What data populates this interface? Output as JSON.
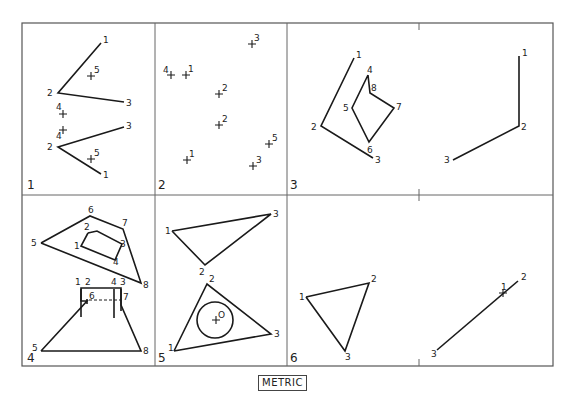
{
  "footer": {
    "label": "METRIC"
  },
  "panels": [
    {
      "id": "1",
      "lines": [
        [
          [
            101,
            43
          ],
          [
            58,
            93
          ],
          [
            124,
            102
          ]
        ],
        [
          [
            124,
            127
          ],
          [
            58,
            147
          ],
          [
            101,
            174
          ]
        ]
      ],
      "points": [
        {
          "t": "1",
          "x": 101,
          "y": 43,
          "dx": 2,
          "dy": 0
        },
        {
          "t": "2",
          "x": 58,
          "y": 93,
          "dx": -11,
          "dy": 3
        },
        {
          "t": "3",
          "x": 124,
          "y": 102,
          "dx": 2,
          "dy": 4
        },
        {
          "t": "5",
          "x": 91,
          "y": 76,
          "dx": 3,
          "dy": -3,
          "cross": true
        },
        {
          "t": "4",
          "x": 63,
          "y": 114,
          "dx": -7,
          "dy": -4,
          "cross": true
        },
        {
          "t": "4",
          "x": 63,
          "y": 130,
          "dx": -7,
          "dy": 9,
          "cross": true
        },
        {
          "t": "3",
          "x": 124,
          "y": 127,
          "dx": 2,
          "dy": 2
        },
        {
          "t": "2",
          "x": 58,
          "y": 147,
          "dx": -11,
          "dy": 3
        },
        {
          "t": "5",
          "x": 91,
          "y": 159,
          "dx": 3,
          "dy": -3,
          "cross": true
        },
        {
          "t": "1",
          "x": 101,
          "y": 174,
          "dx": 2,
          "dy": 4
        }
      ]
    },
    {
      "id": "2",
      "lines": [],
      "points": [
        {
          "t": "3",
          "x": 252,
          "y": 44,
          "dx": 2,
          "dy": -3,
          "cross": true
        },
        {
          "t": "4",
          "x": 171,
          "y": 75,
          "dx": -8,
          "dy": -2,
          "cross": true
        },
        {
          "t": "1",
          "x": 186,
          "y": 75,
          "dx": 2,
          "dy": -3,
          "cross": true
        },
        {
          "t": "2",
          "x": 219,
          "y": 94,
          "dx": 3,
          "dy": -3,
          "cross": true
        },
        {
          "t": "2",
          "x": 219,
          "y": 125,
          "dx": 3,
          "dy": -3,
          "cross": true
        },
        {
          "t": "5",
          "x": 269,
          "y": 144,
          "dx": 3,
          "dy": -3,
          "cross": true
        },
        {
          "t": "1",
          "x": 187,
          "y": 160,
          "dx": 2,
          "dy": -3,
          "cross": true
        },
        {
          "t": "3",
          "x": 253,
          "y": 166,
          "dx": 3,
          "dy": -3,
          "cross": true
        }
      ]
    },
    {
      "id": "3",
      "lines": [
        [
          [
            354,
            58
          ],
          [
            321,
            126
          ],
          [
            373,
            158
          ]
        ],
        [
          [
            368,
            75
          ],
          [
            352,
            108
          ],
          [
            369,
            142
          ],
          [
            394,
            108
          ],
          [
            370,
            93
          ],
          [
            368,
            75
          ]
        ]
      ],
      "points": [
        {
          "t": "1",
          "x": 354,
          "y": 58,
          "dx": 2,
          "dy": 0
        },
        {
          "t": "2",
          "x": 321,
          "y": 126,
          "dx": -10,
          "dy": 4
        },
        {
          "t": "3",
          "x": 373,
          "y": 158,
          "dx": 2,
          "dy": 5
        },
        {
          "t": "4",
          "x": 368,
          "y": 75,
          "dx": -1,
          "dy": -2
        },
        {
          "t": "8",
          "x": 370,
          "y": 93,
          "dx": 1,
          "dy": -2
        },
        {
          "t": "5",
          "x": 352,
          "y": 108,
          "dx": -9,
          "dy": 3
        },
        {
          "t": "7",
          "x": 394,
          "y": 108,
          "dx": 2,
          "dy": 2
        },
        {
          "t": "6",
          "x": 369,
          "y": 142,
          "dx": -2,
          "dy": 11
        }
      ]
    },
    {
      "id": "",
      "lines": [
        [
          [
            519,
            56
          ],
          [
            519,
            126
          ],
          [
            453,
            160
          ]
        ]
      ],
      "points": [
        {
          "t": "1",
          "x": 519,
          "y": 56,
          "dx": 3,
          "dy": 0
        },
        {
          "t": "2",
          "x": 519,
          "y": 126,
          "dx": 2,
          "dy": 4
        },
        {
          "t": "3",
          "x": 453,
          "y": 160,
          "dx": -9,
          "dy": 3
        }
      ]
    },
    {
      "id": "4",
      "lines": [
        [
          [
            41,
            243
          ],
          [
            90,
            216
          ],
          [
            123,
            229
          ],
          [
            141,
            283
          ],
          [
            41,
            243
          ]
        ],
        [
          [
            88,
            233
          ],
          [
            97,
            231
          ],
          [
            122,
            244
          ],
          [
            115,
            260
          ],
          [
            81,
            246
          ],
          [
            88,
            233
          ]
        ],
        [
          [
            41,
            351
          ],
          [
            87,
            301
          ],
          [
            81,
            301
          ],
          [
            81,
            288
          ],
          [
            121,
            288
          ],
          [
            121,
            305
          ],
          [
            141,
            351
          ],
          [
            41,
            351
          ]
        ]
      ],
      "extra": [
        [
          [
            81,
            289
          ],
          [
            81,
            317
          ]
        ],
        [
          [
            114,
            289
          ],
          [
            114,
            318
          ]
        ],
        [
          [
            121,
            289
          ],
          [
            121,
            311
          ]
        ],
        [
          [
            87,
            299
          ],
          [
            87,
            304
          ]
        ]
      ],
      "dashed": [
        [
          [
            89,
            300
          ],
          [
            121,
            300
          ]
        ]
      ],
      "points": [
        {
          "t": "6",
          "x": 90,
          "y": 216,
          "dx": -2,
          "dy": -3
        },
        {
          "t": "7",
          "x": 123,
          "y": 229,
          "dx": -1,
          "dy": -3
        },
        {
          "t": "2",
          "x": 88,
          "y": 233,
          "dx": -4,
          "dy": -3
        },
        {
          "t": "5",
          "x": 41,
          "y": 243,
          "dx": -10,
          "dy": 3
        },
        {
          "t": "1",
          "x": 81,
          "y": 246,
          "dx": -7,
          "dy": 3
        },
        {
          "t": "3",
          "x": 122,
          "y": 244,
          "dx": -2,
          "dy": 3
        },
        {
          "t": "4",
          "x": 115,
          "y": 260,
          "dx": -2,
          "dy": 5
        },
        {
          "t": "8",
          "x": 141,
          "y": 283,
          "dx": 2,
          "dy": 5
        },
        {
          "t": "1",
          "x": 81,
          "y": 288,
          "dx": -6,
          "dy": -3
        },
        {
          "t": "2",
          "x": 86,
          "y": 288,
          "dx": -1,
          "dy": -3
        },
        {
          "t": "4",
          "x": 114,
          "y": 288,
          "dx": -3,
          "dy": -3
        },
        {
          "t": "3",
          "x": 121,
          "y": 288,
          "dx": -1,
          "dy": -3
        },
        {
          "t": "6",
          "x": 89,
          "y": 300,
          "dx": 0,
          "dy": -1
        },
        {
          "t": "7",
          "x": 121,
          "y": 300,
          "dx": 2,
          "dy": 0
        },
        {
          "t": "5",
          "x": 41,
          "y": 351,
          "dx": -9,
          "dy": 0
        },
        {
          "t": "8",
          "x": 141,
          "y": 351,
          "dx": 2,
          "dy": 3
        }
      ]
    },
    {
      "id": "5",
      "lines": [
        [
          [
            172,
            231
          ],
          [
            271,
            214
          ],
          [
            205,
            265
          ],
          [
            172,
            231
          ]
        ],
        [
          [
            174,
            351
          ],
          [
            207,
            284
          ],
          [
            271,
            334
          ],
          [
            174,
            351
          ]
        ]
      ],
      "circle": {
        "cx": 215,
        "cy": 320,
        "r": 18
      },
      "points": [
        {
          "t": "3",
          "x": 271,
          "y": 214,
          "dx": 2,
          "dy": 3
        },
        {
          "t": "1",
          "x": 172,
          "y": 231,
          "dx": -7,
          "dy": 3
        },
        {
          "t": "2",
          "x": 205,
          "y": 265,
          "dx": -6,
          "dy": 10
        },
        {
          "t": "2",
          "x": 207,
          "y": 284,
          "dx": 2,
          "dy": -2
        },
        {
          "t": "O",
          "x": 216,
          "y": 320,
          "dx": 2,
          "dy": -2,
          "cross": true
        },
        {
          "t": "3",
          "x": 271,
          "y": 334,
          "dx": 3,
          "dy": 3
        },
        {
          "t": "1",
          "x": 174,
          "y": 351,
          "dx": -6,
          "dy": 0
        }
      ]
    },
    {
      "id": "6",
      "lines": [
        [
          [
            306,
            297
          ],
          [
            369,
            283
          ],
          [
            345,
            351
          ],
          [
            306,
            297
          ]
        ]
      ],
      "points": [
        {
          "t": "1",
          "x": 306,
          "y": 297,
          "dx": -7,
          "dy": 3
        },
        {
          "t": "2",
          "x": 369,
          "y": 283,
          "dx": 2,
          "dy": -1
        },
        {
          "t": "3",
          "x": 345,
          "y": 351,
          "dx": 0,
          "dy": 9
        }
      ]
    },
    {
      "id": "",
      "lines": [
        [
          [
            437,
            350
          ],
          [
            518,
            281
          ]
        ]
      ],
      "points": [
        {
          "t": "2",
          "x": 518,
          "y": 281,
          "dx": 3,
          "dy": -1
        },
        {
          "t": "1",
          "x": 503,
          "y": 293,
          "dx": -2,
          "dy": -3,
          "cross": true
        },
        {
          "t": "3",
          "x": 437,
          "y": 350,
          "dx": -6,
          "dy": 7
        }
      ]
    }
  ],
  "panel_labels": [
    {
      "t": "1",
      "x": 27,
      "y": 189
    },
    {
      "t": "2",
      "x": 158,
      "y": 189
    },
    {
      "t": "3",
      "x": 290,
      "y": 189
    },
    {
      "t": "4",
      "x": 27,
      "y": 362
    },
    {
      "t": "5",
      "x": 158,
      "y": 362
    },
    {
      "t": "6",
      "x": 290,
      "y": 362
    }
  ]
}
